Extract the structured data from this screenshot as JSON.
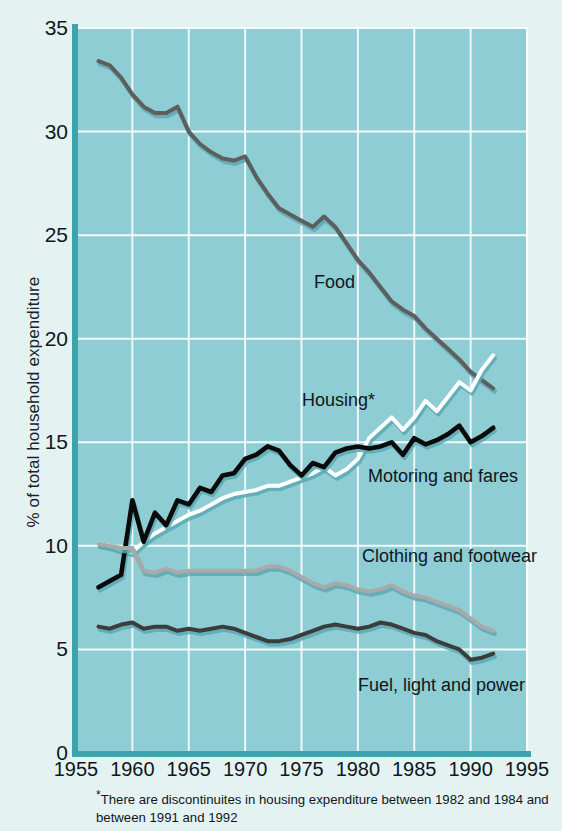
{
  "chart_data": {
    "type": "line",
    "title": "",
    "xlabel": "",
    "ylabel": "% of total household expenditure",
    "xlim": [
      1955,
      1995
    ],
    "ylim": [
      0,
      35
    ],
    "grid": true,
    "legend_position": "inline-labels",
    "xticks": [
      "1955",
      "1960",
      "1965",
      "1970",
      "1975",
      "1980",
      "1985",
      "1990",
      "1995"
    ],
    "yticks": [
      "0",
      "5",
      "10",
      "15",
      "20",
      "25",
      "30",
      "35"
    ],
    "x": [
      1957,
      1958,
      1959,
      1960,
      1961,
      1962,
      1963,
      1964,
      1965,
      1966,
      1967,
      1968,
      1969,
      1970,
      1971,
      1972,
      1973,
      1974,
      1975,
      1976,
      1977,
      1978,
      1979,
      1980,
      1981,
      1982,
      1983,
      1984,
      1985,
      1986,
      1987,
      1988,
      1989,
      1990,
      1991,
      1992
    ],
    "series": [
      {
        "name": "Food",
        "color": "#5e5e5e",
        "values": [
          33.4,
          33.2,
          32.6,
          31.8,
          31.2,
          30.9,
          30.9,
          31.2,
          30.0,
          29.4,
          29.0,
          28.7,
          28.6,
          28.8,
          27.8,
          27.0,
          26.3,
          26.0,
          25.7,
          25.4,
          25.9,
          25.4,
          24.6,
          23.8,
          23.2,
          22.5,
          21.8,
          21.4,
          21.1,
          20.5,
          20.0,
          19.5,
          19.0,
          18.4,
          18.0,
          17.6
        ]
      },
      {
        "name": "Housing*",
        "color": "#ffffff",
        "values": [
          10.1,
          10.0,
          9.8,
          9.7,
          10.2,
          10.6,
          10.9,
          11.2,
          11.5,
          11.7,
          12.0,
          12.3,
          12.5,
          12.6,
          12.7,
          12.9,
          12.9,
          13.1,
          13.3,
          13.5,
          13.8,
          13.4,
          13.7,
          14.2,
          15.2,
          15.7,
          16.2,
          15.6,
          16.2,
          17.0,
          16.5,
          17.2,
          17.9,
          17.5,
          18.5,
          19.2
        ]
      },
      {
        "name": "Motoring and fares",
        "color": "#0a0a0a",
        "values": [
          8.0,
          8.3,
          8.6,
          12.2,
          10.2,
          11.6,
          11.0,
          12.2,
          12.0,
          12.8,
          12.6,
          13.4,
          13.5,
          14.2,
          14.4,
          14.8,
          14.6,
          13.9,
          13.4,
          14.0,
          13.8,
          14.5,
          14.7,
          14.8,
          14.7,
          14.8,
          15.0,
          14.4,
          15.2,
          14.9,
          15.1,
          15.4,
          15.8,
          15.0,
          15.3,
          15.7
        ]
      },
      {
        "name": "Clothing and footwear",
        "color": "#a9a9a9",
        "values": [
          10.1,
          10.0,
          9.9,
          9.9,
          8.8,
          8.7,
          8.9,
          8.7,
          8.8,
          8.8,
          8.8,
          8.8,
          8.8,
          8.8,
          8.8,
          9.0,
          9.0,
          8.8,
          8.5,
          8.2,
          8.0,
          8.2,
          8.1,
          7.9,
          7.8,
          7.9,
          8.1,
          7.8,
          7.6,
          7.5,
          7.3,
          7.1,
          6.9,
          6.5,
          6.1,
          5.9
        ]
      },
      {
        "name": "Fuel, light and power",
        "color": "#3c3c3c",
        "values": [
          6.1,
          6.0,
          6.2,
          6.3,
          6.0,
          6.1,
          6.1,
          5.9,
          6.0,
          5.9,
          6.0,
          6.1,
          6.0,
          5.8,
          5.6,
          5.4,
          5.4,
          5.5,
          5.7,
          5.9,
          6.1,
          6.2,
          6.1,
          6.0,
          6.1,
          6.3,
          6.2,
          6.0,
          5.8,
          5.7,
          5.4,
          5.2,
          5.0,
          4.5,
          4.6,
          4.8
        ]
      }
    ],
    "annotations": [
      {
        "text": "Food",
        "x_px": 314,
        "y_px": 272
      },
      {
        "text": "Housing*",
        "x_px": 302,
        "y_px": 390
      },
      {
        "text": "Motoring and fares",
        "x_px": 368,
        "y_px": 466
      },
      {
        "text": "Clothing and footwear",
        "x_px": 362,
        "y_px": 546
      },
      {
        "text": "Fuel, light and power",
        "x_px": 358,
        "y_px": 675
      }
    ],
    "footnote_marker": "*",
    "footnote": "There are discontinuites in housing expenditure between 1982 and 1984 and between 1991 and 1992",
    "colors": {
      "plot_background": "#8ecdd3",
      "page_background": "#e4f2f2",
      "axis": "#3fa3ac",
      "gridline": "#ffffff"
    }
  }
}
